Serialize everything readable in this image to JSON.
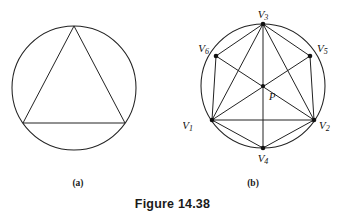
{
  "figure": {
    "caption": "Figure 14.38",
    "panels": [
      {
        "id": "a",
        "sub_caption": "(a)",
        "description": "circle with inscribed triangle"
      },
      {
        "id": "b",
        "sub_caption": "(b)",
        "description": "circle with inscribed hexagon and diagonals meeting at P"
      }
    ]
  },
  "panel_a": {
    "circle": {
      "cx": 66,
      "cy": 66,
      "r": 62
    },
    "triangle_vertices": [
      {
        "name": "apex",
        "x": 66,
        "y": 4
      },
      {
        "name": "base-left",
        "x": 15,
        "y": 101
      },
      {
        "name": "base-right",
        "x": 117,
        "y": 101
      }
    ]
  },
  "panel_b": {
    "circle": {
      "cx": 72,
      "cy": 72,
      "r": 62
    },
    "vertices": [
      {
        "id": "V1",
        "label": "V",
        "subscript": "1",
        "x": 21,
        "y": 106,
        "label_x": 2,
        "label_y": 115,
        "anchor": "end"
      },
      {
        "id": "V2",
        "label": "V",
        "subscript": "2",
        "x": 123,
        "y": 106,
        "label_x": 128,
        "label_y": 115,
        "anchor": "start"
      },
      {
        "id": "V3",
        "label": "V",
        "subscript": "3",
        "x": 72,
        "y": 10,
        "label_x": 72,
        "label_y": 4,
        "anchor": "middle"
      },
      {
        "id": "V4",
        "label": "V",
        "subscript": "4",
        "x": 72,
        "y": 134,
        "label_x": 72,
        "label_y": 148,
        "anchor": "middle"
      },
      {
        "id": "V5",
        "label": "V",
        "subscript": "5",
        "x": 119,
        "y": 42,
        "label_x": 126,
        "label_y": 38,
        "anchor": "start"
      },
      {
        "id": "V6",
        "label": "V",
        "subscript": "6",
        "x": 25,
        "y": 42,
        "label_x": 18,
        "label_y": 38,
        "anchor": "end"
      }
    ],
    "center_point": {
      "id": "P",
      "label": "P",
      "x": 72,
      "y": 72,
      "label_x": 78,
      "label_y": 86
    },
    "edges": [
      {
        "from": "V1",
        "to": "V2"
      },
      {
        "from": "V1",
        "to": "V3"
      },
      {
        "from": "V1",
        "to": "V4"
      },
      {
        "from": "V1",
        "to": "V5"
      },
      {
        "from": "V1",
        "to": "V6"
      },
      {
        "from": "V2",
        "to": "V3"
      },
      {
        "from": "V2",
        "to": "V4"
      },
      {
        "from": "V2",
        "to": "V5"
      },
      {
        "from": "V2",
        "to": "V6"
      },
      {
        "from": "V3",
        "to": "V4"
      },
      {
        "from": "V3",
        "to": "V5"
      },
      {
        "from": "V3",
        "to": "V6"
      }
    ]
  },
  "style": {
    "stroke_color": "#222222",
    "background": "#ffffff",
    "text_color": "#1a1a1a"
  }
}
